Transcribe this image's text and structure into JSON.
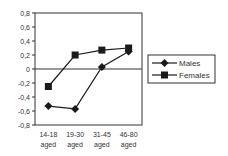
{
  "chart_data": {
    "type": "line",
    "title": "",
    "xlabel": "",
    "ylabel": "",
    "categories": [
      [
        "14-18",
        "aged"
      ],
      [
        "19-30",
        "aged"
      ],
      [
        "31-45",
        "aged"
      ],
      [
        "46-80",
        "aged"
      ]
    ],
    "series": [
      {
        "name": "Males",
        "marker": "diamond",
        "values": [
          -0.53,
          -0.57,
          0.03,
          0.25
        ]
      },
      {
        "name": "Females",
        "marker": "square",
        "values": [
          -0.25,
          0.2,
          0.27,
          0.3
        ]
      }
    ],
    "ylim": [
      -0.8,
      0.8
    ],
    "yticks": [
      0.8,
      0.6,
      0.4,
      0.2,
      0,
      -0.2,
      -0.4,
      -0.6,
      -0.8
    ],
    "ytick_labels": [
      "0,8",
      "0,6",
      "0,4",
      "0,2",
      "0",
      "-0,2",
      "-0,4",
      "-0,6",
      "-0,8"
    ],
    "grid": false,
    "zero_line": true,
    "legend_position": "right"
  },
  "colors": {
    "line": "#1a1a1a",
    "axis": "#333333",
    "text": "#333333"
  }
}
